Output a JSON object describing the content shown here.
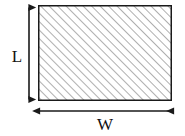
{
  "figure": {
    "type": "geometry-diagram",
    "shape": "rectangle",
    "canvas": {
      "width": 185,
      "height": 136,
      "background": "#ffffff"
    },
    "rectangle": {
      "name": "hatched-rectangle",
      "x": 38,
      "y": 5,
      "width": 134,
      "height": 96,
      "stroke_color": "#1a1a1a",
      "stroke_width": 1.5,
      "fill": "#ffffff",
      "hatch": {
        "pattern": "diagonal-lines",
        "direction": "lower-left-to-upper-right",
        "angle_degrees": 45,
        "spacing_px": 6,
        "line_color": "#8c8c8c",
        "line_width": 1.4
      }
    },
    "dimensions": [
      {
        "id": "length",
        "label": "L",
        "orientation": "vertical",
        "arrow_style": "double-headed",
        "arrow_color": "#1a1a1a",
        "line_x": 29,
        "y_start": 6,
        "y_end": 101,
        "label_x": 17,
        "label_y": 58
      },
      {
        "id": "width",
        "label": "W",
        "orientation": "horizontal",
        "arrow_style": "double-headed",
        "arrow_color": "#1a1a1a",
        "line_y": 111,
        "x_start": 38,
        "x_end": 175,
        "label_x": 105,
        "label_y": 130
      }
    ]
  }
}
